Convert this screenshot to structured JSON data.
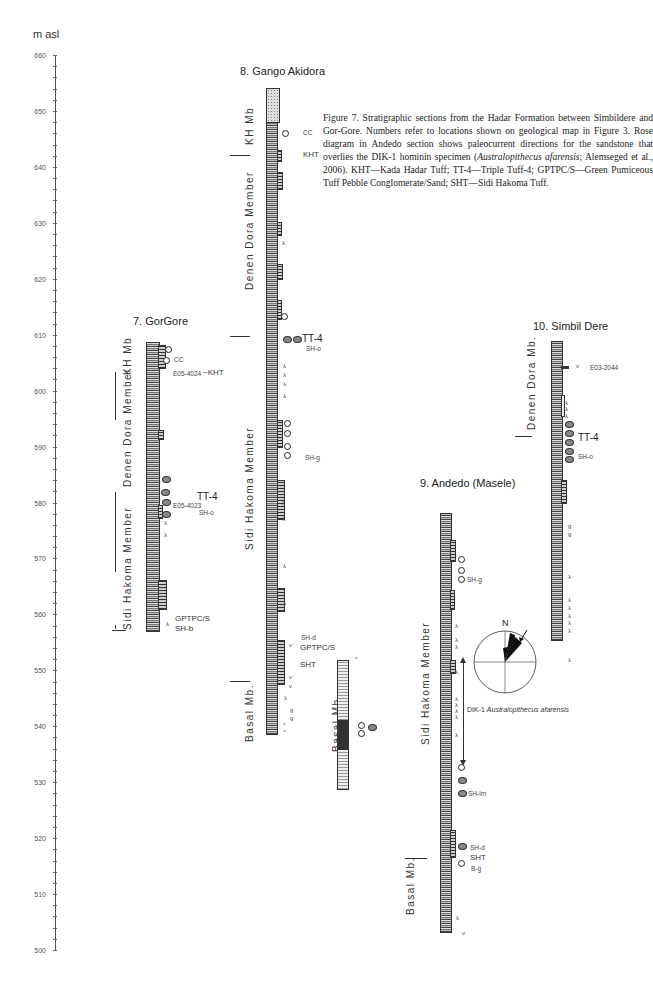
{
  "axis": {
    "title": "m asl",
    "min": 500,
    "max": 660,
    "major_step": 10,
    "minor_step": 2,
    "ticks": [
      "660",
      "650",
      "640",
      "630",
      "620",
      "610",
      "600",
      "590",
      "580",
      "570",
      "560",
      "550",
      "540",
      "530",
      "520",
      "510",
      "500"
    ]
  },
  "caption": {
    "lead": "Figure 7. Stratigraphic sections from the Hadar Formation between Simbildere and Gor-Gore. Numbers refer to locations shown on geological map in Figure 3. Rose diagram in Andedo section shows paleocurrent directions for the sandstone that overlies the DIK-1 hominin specimen (",
    "italic": "Australopithecus afarensis",
    "tail": "; Alemseged et al., 2006). KHT—Kada Hadar Tuff; TT-4—Triple Tuff-4; GPTPC/S—Green Pumiceous Tuff Pebble Conglomerate/Sand; SHT—Sidi Hakoma Tuff."
  },
  "sections": [
    {
      "title": "7. GorGore",
      "members": [
        "KH Mb",
        "Denen Dora Member",
        "Sidi Hakoma Member"
      ],
      "labels": {
        "cc": "CC",
        "sample1": "E05-4024",
        "kht": "~KHT",
        "tt4": "TT-4",
        "sample2": "E05-4023",
        "sho": "SH-o",
        "gptpc": "GPTPC/S",
        "shb": "SH-b"
      }
    },
    {
      "title": "8. Gango Akidora",
      "members": [
        "KH Mb",
        "Denen Dora Member",
        "Sidi Hakoma Member",
        "Basal Mb."
      ],
      "labels": {
        "cc": "CC",
        "kht": "KHT",
        "tt4": "TT-4",
        "sho": "SH-o",
        "shg": "SH-g",
        "shd": "SH-d",
        "gptpc": "GPTPC/S",
        "sht": "SHT"
      }
    },
    {
      "title": "9. Andedo (Masele)",
      "members": [
        "Sidi Hakoma Member",
        "Basal Mb."
      ],
      "labels": {
        "shg": "SH-g",
        "shlm": "SH-lm",
        "shd": "SH-d",
        "sht": "SHT",
        "bg": "B-g"
      }
    },
    {
      "title": "10. Simbil Dere",
      "members": [
        "Denen Dora Mb."
      ],
      "labels": {
        "sample": "E03-2044",
        "tt4": "TT-4",
        "sho": "SH-o"
      }
    }
  ],
  "rose": {
    "north": "N",
    "specimen": "DIK-1",
    "specimen_italic": "Australopithecus afarensis"
  },
  "symbols": {
    "lambda": "λ",
    "v": "v",
    "g": "g",
    "caret": "^"
  }
}
